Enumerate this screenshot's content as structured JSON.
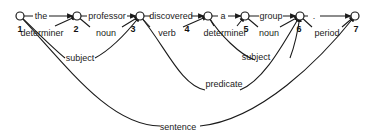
{
  "diagram": {
    "type": "dependency-parse-graph",
    "nodes": [
      {
        "id": "1",
        "label": "1"
      },
      {
        "id": "2",
        "label": "2"
      },
      {
        "id": "3",
        "label": "3"
      },
      {
        "id": "4",
        "label": "4"
      },
      {
        "id": "5",
        "label": "5"
      },
      {
        "id": "6",
        "label": "6"
      },
      {
        "id": "7",
        "label": "7"
      }
    ],
    "word_edges": [
      {
        "from": "1",
        "to": "2",
        "label": "the"
      },
      {
        "from": "2",
        "to": "3",
        "label": "professor"
      },
      {
        "from": "3",
        "to": "4",
        "label": "discovered"
      },
      {
        "from": "4",
        "to": "5",
        "label": "a"
      },
      {
        "from": "5",
        "to": "6",
        "label": "group"
      },
      {
        "from": "6",
        "to": "7",
        "label": "."
      }
    ],
    "phrase_edges": [
      {
        "from": "1",
        "to": "2",
        "label": "determiner"
      },
      {
        "from": "2",
        "to": "3",
        "label": "noun"
      },
      {
        "from": "3",
        "to": "4",
        "label": "verb"
      },
      {
        "from": "4",
        "to": "5",
        "label": "determiner"
      },
      {
        "from": "5",
        "to": "6",
        "label": "noun"
      },
      {
        "from": "1",
        "to": "3",
        "label": "subject"
      },
      {
        "from": "4",
        "to": "6",
        "label": "subject"
      },
      {
        "from": "3",
        "to": "6",
        "label": "predicate"
      },
      {
        "from": "6",
        "to": "7",
        "label": "period"
      },
      {
        "from": "1",
        "to": "7",
        "label": "sentence"
      }
    ]
  }
}
